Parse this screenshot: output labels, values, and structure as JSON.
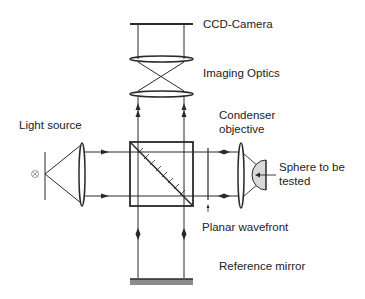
{
  "diagram": {
    "type": "optical-interferometer-schematic",
    "labels": {
      "ccd_camera": "CCD-Camera",
      "imaging_optics": "Imaging Optics",
      "condenser_line1": "Condenser",
      "condenser_line2": "objective",
      "light_source": "Light source",
      "sphere_line1": "Sphere to be",
      "sphere_line2": "tested",
      "planar_wavefront": "Planar wavefront",
      "reference_mirror": "Reference mirror"
    },
    "components": [
      {
        "id": "ccd-camera",
        "label": "CCD-Camera"
      },
      {
        "id": "imaging-optics",
        "label": "Imaging Optics",
        "lenses": 2
      },
      {
        "id": "light-source",
        "label": "Light source",
        "symbol": "⊗"
      },
      {
        "id": "collimator-lens",
        "label": ""
      },
      {
        "id": "beam-splitter-cube",
        "label": ""
      },
      {
        "id": "planar-wavefront",
        "label": "Planar wavefront"
      },
      {
        "id": "condenser-objective",
        "label": "Condenser objective"
      },
      {
        "id": "test-sphere",
        "label": "Sphere to be tested"
      },
      {
        "id": "reference-mirror",
        "label": "Reference mirror"
      }
    ],
    "colors": {
      "line": "#2a2a2a",
      "sphere_fill": "#d9d9d9",
      "mirror_fill": "#8c8c8c",
      "text": "#222222",
      "background": "#ffffff"
    }
  }
}
